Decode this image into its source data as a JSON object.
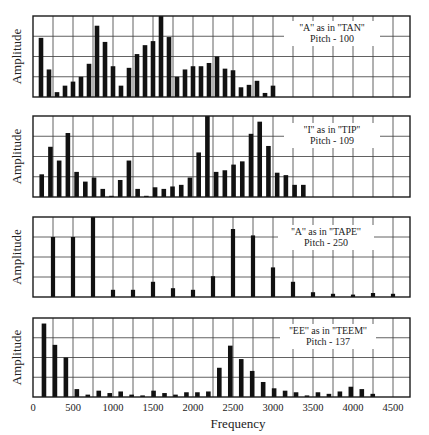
{
  "figure": {
    "xlabel": "Frequency",
    "ylabel": "Amplitude",
    "x_ticks": [
      "0",
      "500",
      "1000",
      "1500",
      "2000",
      "2500",
      "3000",
      "3500",
      "4000",
      "4500"
    ]
  },
  "chart_data": [
    {
      "type": "bar",
      "title": "\"A\" as in \"TAN\"",
      "subtitle": "Pitch - 100",
      "annotation_line1": "''A'' as in ''TAN''",
      "annotation_line2": "Pitch - 100",
      "pitch": 100,
      "xlabel": "Frequency",
      "ylabel": "Amplitude",
      "xlim": [
        0,
        4800
      ],
      "ylim": [
        0,
        100
      ],
      "grid": true,
      "x": [
        100,
        200,
        300,
        400,
        500,
        600,
        700,
        800,
        900,
        1000,
        1100,
        1200,
        1300,
        1400,
        1500,
        1600,
        1700,
        1800,
        1900,
        2000,
        2100,
        2200,
        2300,
        2400,
        2500,
        2600,
        2700,
        2800,
        2900
      ],
      "values": [
        73,
        34,
        6,
        14,
        19,
        25,
        41,
        88,
        68,
        38,
        14,
        36,
        53,
        64,
        69,
        100,
        74,
        25,
        34,
        38,
        38,
        42,
        50,
        35,
        33,
        12,
        15,
        20,
        5,
        14
      ]
    },
    {
      "type": "bar",
      "title": "\"I\" as in \"TIP\"",
      "subtitle": "Pitch - 109",
      "annotation_line1": "''I'' as in ''TIP''",
      "annotation_line2": "Pitch - 109",
      "pitch": 109,
      "xlabel": "Frequency",
      "ylabel": "Amplitude",
      "xlim": [
        0,
        4800
      ],
      "ylim": [
        0,
        100
      ],
      "grid": true,
      "x": [
        109,
        218,
        327,
        436,
        545,
        654,
        763,
        872,
        981,
        1090,
        1199,
        1308,
        1417,
        1526,
        1635,
        1744,
        1853,
        1962,
        2071,
        2180,
        2289,
        2398,
        2507,
        2616,
        2725,
        2834,
        2943,
        3052,
        3161,
        3270
      ],
      "values": [
        28,
        62,
        45,
        79,
        31,
        19,
        24,
        10,
        1,
        21,
        45,
        10,
        1,
        12,
        10,
        13,
        15,
        24,
        55,
        100,
        31,
        33,
        40,
        44,
        78,
        93,
        63,
        30,
        27,
        15,
        15
      ]
    },
    {
      "type": "bar",
      "title": "\"A\" as in \"TAPE\"",
      "subtitle": "Pitch - 250",
      "annotation_line1": "''A'' as in ''TAPE''",
      "annotation_line2": "Pitch - 250",
      "pitch": 250,
      "xlabel": "Frequency",
      "ylabel": "Amplitude",
      "xlim": [
        0,
        4800
      ],
      "ylim": [
        0,
        100
      ],
      "grid": true,
      "x": [
        250,
        500,
        750,
        1000,
        1250,
        1500,
        1750,
        2000,
        2250,
        2500,
        2750,
        3000,
        3250,
        3500,
        3750,
        4000,
        4250,
        4500
      ],
      "values": [
        75,
        75,
        100,
        9,
        9,
        19,
        11,
        9,
        26,
        85,
        77,
        37,
        19,
        6,
        4,
        3,
        5,
        4,
        1
      ]
    },
    {
      "type": "bar",
      "title": "\"EE\" as in \"TEEM\"",
      "subtitle": "Pitch - 137",
      "annotation_line1": "''EE'' as in ''TEEM''",
      "annotation_line2": "Pitch - 137",
      "pitch": 137,
      "xlabel": "Frequency",
      "ylabel": "Amplitude",
      "xlim": [
        0,
        4800
      ],
      "ylim": [
        0,
        100
      ],
      "grid": true,
      "x": [
        137,
        274,
        411,
        548,
        685,
        822,
        959,
        1096,
        1233,
        1370,
        1507,
        1644,
        1781,
        1918,
        2055,
        2192,
        2329,
        2466,
        2603,
        2740,
        2877,
        3014,
        3151,
        3288,
        3425,
        3562,
        3699,
        3836,
        3973,
        4110,
        4247
      ],
      "values": [
        93,
        66,
        50,
        10,
        3,
        8,
        5,
        7,
        3,
        2,
        8,
        5,
        3,
        6,
        6,
        7,
        37,
        65,
        48,
        33,
        19,
        11,
        8,
        6,
        2,
        6,
        4,
        7,
        13,
        10,
        4
      ]
    }
  ]
}
